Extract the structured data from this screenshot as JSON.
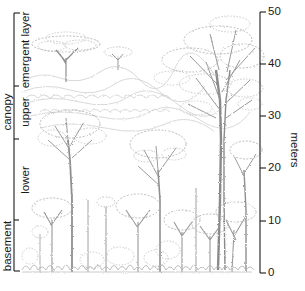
{
  "diagram": {
    "colors": {
      "ink": "#1a1a1a",
      "sketch": "#9a9a9a",
      "sketch_light": "#c4c4c4",
      "background": "#ffffff"
    }
  },
  "left_bracket": {
    "group_label": "canopy",
    "layers": [
      {
        "id": "emergent",
        "label": "emergent layer",
        "top_px": 13,
        "bottom_px": 86
      },
      {
        "id": "upper",
        "label": "upper",
        "top_px": 86,
        "bottom_px": 139
      },
      {
        "id": "lower",
        "label": "lower",
        "top_px": 139,
        "bottom_px": 220
      },
      {
        "id": "basement",
        "label": "basement",
        "top_px": 220,
        "bottom_px": 271
      }
    ],
    "canopy_span": {
      "top_px": 86,
      "bottom_px": 220
    }
  },
  "height_axis": {
    "label": "meters",
    "unit": "m",
    "min": 0,
    "max": 50,
    "ticks": [
      {
        "value": 0,
        "label": "0"
      },
      {
        "value": 10,
        "label": "10"
      },
      {
        "value": 20,
        "label": "20"
      },
      {
        "value": 30,
        "label": "30"
      },
      {
        "value": 40,
        "label": "40"
      },
      {
        "value": 50,
        "label": "50"
      }
    ]
  }
}
